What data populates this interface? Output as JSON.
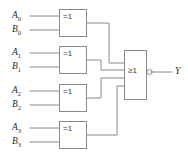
{
  "diagram": {
    "stroke_color": "#8a8a8a",
    "text_color": "#2b2b2b",
    "background": "#ffffff"
  },
  "inputs": [
    {
      "a_letter": "A",
      "a_sub": "0",
      "b_letter": "B",
      "b_sub": "0"
    },
    {
      "a_letter": "A",
      "a_sub": "1",
      "b_letter": "B",
      "b_sub": "1"
    },
    {
      "a_letter": "A",
      "a_sub": "2",
      "b_letter": "B",
      "b_sub": "2"
    },
    {
      "a_letter": "A",
      "a_sub": "3",
      "b_letter": "B",
      "b_sub": "3"
    }
  ],
  "xor_gates": [
    {
      "symbol": "=1"
    },
    {
      "symbol": "=1"
    },
    {
      "symbol": "=1"
    },
    {
      "symbol": "=1"
    }
  ],
  "or_gate": {
    "symbol": "≥1",
    "inverted_output": true
  },
  "output": {
    "label": "Y"
  }
}
